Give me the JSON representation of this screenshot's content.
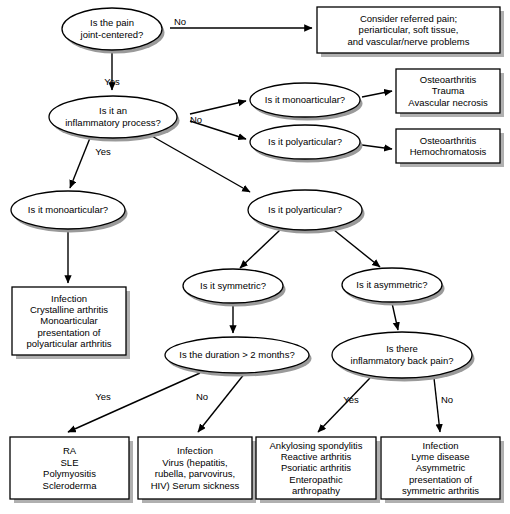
{
  "diagram": {
    "type": "flowchart",
    "colors": {
      "background": "#ffffff",
      "shape_fill": "#ffffff",
      "shape_stroke": "#000000",
      "shadow": "#9a9a9a",
      "text": "#000000"
    },
    "decisions": [
      {
        "id": "d1",
        "name": "pain-joint-centered",
        "lines": [
          "Is the pain",
          "joint-centered?"
        ],
        "cx": 112,
        "cy": 29,
        "rx": 50,
        "ry": 21
      },
      {
        "id": "d2",
        "name": "inflammatory-process",
        "lines": [
          "Is it an",
          "inflammatory process?"
        ],
        "cx": 113,
        "cy": 117,
        "rx": 64,
        "ry": 21
      },
      {
        "id": "d3",
        "name": "monoarticular-noninflammatory",
        "lines": [
          "Is it monoarticular?"
        ],
        "cx": 305,
        "cy": 100,
        "rx": 55,
        "ry": 17
      },
      {
        "id": "d4",
        "name": "polyarticular-noninflammatory",
        "lines": [
          "Is it polyarticular?"
        ],
        "cx": 305,
        "cy": 142,
        "rx": 55,
        "ry": 17
      },
      {
        "id": "d5",
        "name": "monoarticular-inflammatory",
        "lines": [
          "Is it monoarticular?"
        ],
        "cx": 68,
        "cy": 210,
        "rx": 57,
        "ry": 19
      },
      {
        "id": "d6",
        "name": "polyarticular-inflammatory",
        "lines": [
          "Is it polyarticular?"
        ],
        "cx": 305,
        "cy": 210,
        "rx": 57,
        "ry": 20
      },
      {
        "id": "d7",
        "name": "symmetric",
        "lines": [
          "Is it symmetric?"
        ],
        "cx": 233,
        "cy": 286,
        "rx": 50,
        "ry": 17
      },
      {
        "id": "d8",
        "name": "asymmetric",
        "lines": [
          "Is it asymmetric?"
        ],
        "cx": 392,
        "cy": 285,
        "rx": 50,
        "ry": 17
      },
      {
        "id": "d9",
        "name": "duration-over-2-months",
        "lines": [
          "Is the duration > 2 months?"
        ],
        "cx": 237,
        "cy": 355,
        "rx": 72,
        "ry": 18
      },
      {
        "id": "d10",
        "name": "inflammatory-back-pain",
        "lines": [
          "Is there",
          "inflammatory back pain?"
        ],
        "cx": 402,
        "cy": 355,
        "rx": 70,
        "ry": 23
      }
    ],
    "outcomes": [
      {
        "id": "b1",
        "name": "referred-pain-outcome",
        "lines": [
          "Consider referred pain;",
          "periarticular, soft tissue,",
          "and vascular/nerve problems"
        ],
        "x": 317,
        "y": 7,
        "w": 183,
        "h": 46
      },
      {
        "id": "b2",
        "name": "osteoarthritis-trauma-outcome",
        "lines": [
          "Osteoarthritis",
          "Trauma",
          "Avascular necrosis"
        ],
        "x": 396,
        "y": 69,
        "w": 104,
        "h": 44
      },
      {
        "id": "b3",
        "name": "osteoarthritis-hemochromatosis-outcome",
        "lines": [
          "Osteoarthritis",
          "Hemochromatosis"
        ],
        "x": 396,
        "y": 129,
        "w": 104,
        "h": 34
      },
      {
        "id": "b4",
        "name": "monoarticular-infection-outcome",
        "lines": [
          "Infection",
          "Crystalline arthritis",
          "Monoarticular",
          "presentation of",
          "polyarticular arthritis"
        ],
        "x": 12,
        "y": 287,
        "w": 114,
        "h": 68
      },
      {
        "id": "b5",
        "name": "ra-sle-outcome",
        "lines": [
          "RA",
          "SLE",
          "Polymyositis",
          "Scleroderma"
        ],
        "x": 10,
        "y": 437,
        "w": 119,
        "h": 62
      },
      {
        "id": "b6",
        "name": "infection-virus-outcome",
        "lines": [
          "Infection",
          "Virus (hepatitis,",
          "rubella, parvovirus,",
          "HIV) Serum sickness"
        ],
        "x": 138,
        "y": 437,
        "w": 114,
        "h": 62
      },
      {
        "id": "b7",
        "name": "spondyloarthropathy-outcome",
        "lines": [
          "Ankylosing spondylitis",
          "Reactive arthritis",
          "Psoriatic arthritis",
          "Enteropathic",
          "arthropathy"
        ],
        "x": 256,
        "y": 437,
        "w": 120,
        "h": 62
      },
      {
        "id": "b8",
        "name": "lyme-asymmetric-outcome",
        "lines": [
          "Infection",
          "Lyme disease",
          "Asymmetric",
          "presentation of",
          "symmetric arthritis"
        ],
        "x": 381,
        "y": 437,
        "w": 119,
        "h": 62
      }
    ],
    "edges": [
      {
        "name": "edge-pain-no-to-referred",
        "points": "170,28 312,28",
        "arrow": true
      },
      {
        "name": "edge-pain-yes-to-inflammatory",
        "points": "112,50 112,90",
        "arrow": true
      },
      {
        "name": "edge-inflammatory-no-to-mono",
        "points": "190,114 246,101",
        "arrow": true
      },
      {
        "name": "edge-inflammatory-no-to-poly",
        "points": "190,121 246,139",
        "arrow": true
      },
      {
        "name": "edge-mono-to-osteo-trauma",
        "points": "362,97 392,91",
        "arrow": true
      },
      {
        "name": "edge-poly-to-osteo-hemo",
        "points": "362,145 392,149",
        "arrow": true
      },
      {
        "name": "edge-inflammatory-yes-to-mono",
        "points": "90,138 70,188",
        "arrow": true
      },
      {
        "name": "edge-inflammatory-yes-to-poly",
        "points": "150,135 250,192",
        "arrow": true
      },
      {
        "name": "edge-mono-to-infection-box",
        "points": "68,230 68,283",
        "arrow": true
      },
      {
        "name": "edge-poly-to-symmetric",
        "points": "280,230 240,268",
        "arrow": true
      },
      {
        "name": "edge-poly-to-asymmetric",
        "points": "334,230 380,267",
        "arrow": true
      },
      {
        "name": "edge-symmetric-to-duration",
        "points": "233,304 233,333",
        "arrow": true
      },
      {
        "name": "edge-asymmetric-to-backpain",
        "points": "392,303 398,330",
        "arrow": true
      },
      {
        "name": "edge-duration-yes-to-ra",
        "points": "200,373 68,432",
        "arrow": true
      },
      {
        "name": "edge-duration-no-to-infection",
        "points": "245,373 198,432",
        "arrow": true
      },
      {
        "name": "edge-backpain-yes-to-spondy",
        "points": "370,378 318,432",
        "arrow": true
      },
      {
        "name": "edge-backpain-no-to-lyme",
        "points": "434,378 440,432",
        "arrow": true
      }
    ],
    "edge_labels": [
      {
        "name": "label-pain-no",
        "text": "No",
        "x": 180,
        "y": 25
      },
      {
        "name": "label-pain-yes",
        "text": "Yes",
        "x": 112,
        "y": 85
      },
      {
        "name": "label-inflammatory-no",
        "text": "No",
        "x": 196,
        "y": 123
      },
      {
        "name": "label-inflammatory-yes",
        "text": "Yes",
        "x": 103,
        "y": 155
      },
      {
        "name": "label-duration-yes",
        "text": "Yes",
        "x": 103,
        "y": 400
      },
      {
        "name": "label-duration-no",
        "text": "No",
        "x": 202,
        "y": 400
      },
      {
        "name": "label-backpain-yes",
        "text": "Yes",
        "x": 351,
        "y": 403
      },
      {
        "name": "label-backpain-no",
        "text": "No",
        "x": 447,
        "y": 403
      }
    ]
  }
}
